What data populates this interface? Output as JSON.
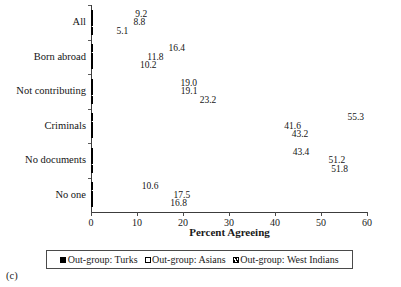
{
  "panel_label": "(c)",
  "legend": {
    "position": "bottom",
    "entries": [
      {
        "label": "Out-group: Turks",
        "style": "solid-black",
        "color": "#000000"
      },
      {
        "label": "Out-group: Asians",
        "style": "hollow-white",
        "color": "#ffffff"
      },
      {
        "label": "Out-group: West Indians",
        "style": "diagonal-hatch",
        "color": "#ffffff"
      }
    ]
  },
  "chart_data": {
    "type": "bar",
    "orientation": "horizontal",
    "title": "",
    "subtitle": "",
    "xlabel": "Percent Agreeing",
    "ylabel": "",
    "xlim": [
      0,
      60
    ],
    "xticks": [
      0,
      10,
      20,
      30,
      40,
      50,
      60
    ],
    "grid": false,
    "categories": [
      "All",
      "Born abroad",
      "Not contributing",
      "Criminals",
      "No documents",
      "No one"
    ],
    "series": [
      {
        "name": "Out-group: Turks",
        "values": [
          9.2,
          16.4,
          19.0,
          55.3,
          43.4,
          10.6
        ],
        "labels": [
          "9.2",
          "16.4",
          "19.0",
          "55.3",
          "43.4",
          "10.6"
        ]
      },
      {
        "name": "Out-group: Asians",
        "values": [
          8.8,
          11.8,
          19.1,
          41.6,
          51.2,
          17.5
        ],
        "labels": [
          "8.8",
          "11.8",
          "19.1",
          "41.6",
          "51.2",
          "17.5"
        ]
      },
      {
        "name": "Out-group: West Indians",
        "values": [
          5.1,
          10.2,
          23.2,
          43.2,
          51.8,
          16.8
        ],
        "labels": [
          "5.1",
          "10.2",
          "23.2",
          "43.2",
          "51.8",
          "16.8"
        ]
      }
    ]
  }
}
